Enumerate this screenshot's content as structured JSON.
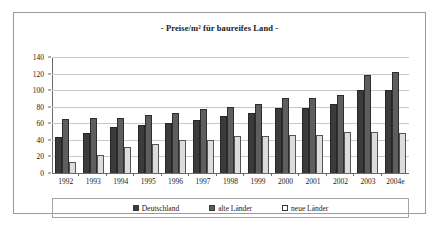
{
  "chart_data": {
    "type": "bar",
    "title": "- Preise/m² für baureifes Land -",
    "xlabel": "",
    "ylabel": "",
    "ylim": [
      0,
      140
    ],
    "yticks": [
      0,
      20,
      40,
      60,
      80,
      100,
      120,
      140
    ],
    "grid": true,
    "legend_position": "bottom",
    "categories": [
      "1992",
      "1993",
      "1994",
      "1995",
      "1996",
      "1997",
      "1998",
      "1999",
      "2000",
      "2001",
      "2002",
      "2003",
      "2004e"
    ],
    "series": [
      {
        "name": "Deutschland",
        "color": "#3b3b3b",
        "values": [
          43,
          48,
          55,
          58,
          60,
          64,
          69,
          73,
          78,
          79,
          83,
          100,
          100
        ]
      },
      {
        "name": "alte Länder",
        "color": "#5e5e5e",
        "values": [
          65,
          66,
          67,
          70,
          73,
          77,
          80,
          83,
          90,
          90,
          94,
          118,
          122
        ]
      },
      {
        "name": "neue Länder",
        "color": "#dcdcdc",
        "values": [
          13,
          22,
          32,
          35,
          40,
          40,
          45,
          45,
          46,
          46,
          50,
          50,
          48
        ]
      }
    ]
  },
  "legend": {
    "items": [
      {
        "label": "Deutschland",
        "swatch": "dark-gray-swatch"
      },
      {
        "label": "alte Länder",
        "swatch": "medium-gray-swatch"
      },
      {
        "label": "neue Länder",
        "swatch": "white-swatch"
      }
    ]
  }
}
